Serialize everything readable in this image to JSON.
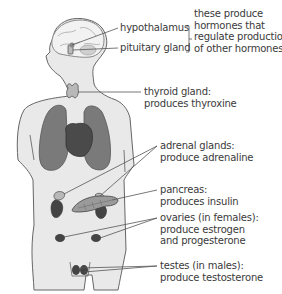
{
  "figure": {
    "colors": {
      "body": "#e9e9e9",
      "outline": "#666666",
      "lungs": "#7a7a7a",
      "heart": "#4a4a4a",
      "gland_light": "#b8b8b8",
      "gland_dark": "#444444",
      "leader": "#555555",
      "text": "#3a3a3a"
    },
    "labels": {
      "hypothalamus": "hypothalamus",
      "pituitary": "pituitary gland",
      "brain_note": [
        "these produce",
        "hormones that",
        "regulate production",
        "of other hormones"
      ],
      "thyroid": [
        "thyroid gland:",
        "produces thyroxine"
      ],
      "adrenal": [
        "adrenal glands:",
        "produce adrenaline"
      ],
      "pancreas": [
        "pancreas:",
        "produces insulin"
      ],
      "ovaries": [
        "ovaries (in females):",
        "produce estrogen",
        "and progesterone"
      ],
      "testes": [
        "testes (in males):",
        "produce testosterone"
      ]
    }
  }
}
